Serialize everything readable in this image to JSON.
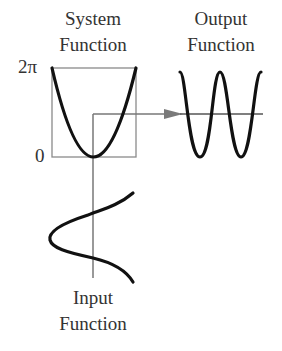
{
  "labels": {
    "system": {
      "line1": "System",
      "line2": "Function"
    },
    "output": {
      "line1": "Output",
      "line2": "Function"
    },
    "input": {
      "line1": "Input",
      "line2": "Function"
    }
  },
  "axis_ticks": {
    "top": "2π",
    "bottom": "0"
  },
  "colors": {
    "curve": "#111111",
    "frame": "#8a8a8a",
    "guide": "#666666",
    "arrowhead": "#7a7a7a",
    "text": "#333333"
  },
  "diagram": {
    "system_function": {
      "shape": "parabola",
      "range": [
        "0",
        "2π"
      ]
    },
    "input_function": {
      "shape": "sinusoid (vertical axis)"
    },
    "output_function": {
      "shape": "sinusoid (cos of parabola)"
    },
    "flow": "input → system → output"
  }
}
